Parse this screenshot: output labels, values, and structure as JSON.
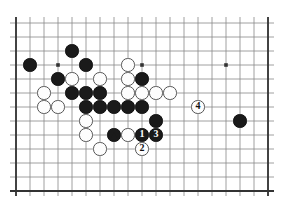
{
  "app": {
    "title": "Go board diagram",
    "type": "go-game-diagram"
  },
  "board": {
    "name": "go-board",
    "columns": 19,
    "rows": 13,
    "visible_columns": 19,
    "visible_rows": 13,
    "origin_x": 16,
    "origin_y": 23,
    "spacing": 14,
    "line_color": "#888888",
    "border_color": "#333333",
    "background_color": "#ffffff",
    "star_points": [
      {
        "col": 3,
        "row": 3
      },
      {
        "col": 9,
        "row": 3
      },
      {
        "col": 15,
        "row": 3
      }
    ],
    "edges": {
      "left": true,
      "top": true,
      "right": true,
      "bottom": true
    }
  },
  "stones": [
    {
      "col": 4,
      "row": 2,
      "color": "black",
      "label": "",
      "marker": ""
    },
    {
      "col": 1,
      "row": 3,
      "color": "black",
      "label": "",
      "marker": ""
    },
    {
      "col": 5,
      "row": 3,
      "color": "black",
      "label": "",
      "marker": ""
    },
    {
      "col": 8,
      "row": 3,
      "color": "white",
      "label": "",
      "marker": ""
    },
    {
      "col": 3,
      "row": 4,
      "color": "black",
      "label": "",
      "marker": ""
    },
    {
      "col": 4,
      "row": 4,
      "color": "white",
      "label": "",
      "marker": ""
    },
    {
      "col": 6,
      "row": 4,
      "color": "white",
      "label": "",
      "marker": ""
    },
    {
      "col": 8,
      "row": 4,
      "color": "white",
      "label": "",
      "marker": ""
    },
    {
      "col": 9,
      "row": 4,
      "color": "black",
      "label": "",
      "marker": ""
    },
    {
      "col": 2,
      "row": 5,
      "color": "white",
      "label": "",
      "marker": ""
    },
    {
      "col": 4,
      "row": 5,
      "color": "black",
      "label": "",
      "marker": ""
    },
    {
      "col": 5,
      "row": 5,
      "color": "black",
      "label": "",
      "marker": ""
    },
    {
      "col": 6,
      "row": 5,
      "color": "black",
      "label": "",
      "marker": ""
    },
    {
      "col": 8,
      "row": 5,
      "color": "white",
      "label": "",
      "marker": ""
    },
    {
      "col": 9,
      "row": 5,
      "color": "white",
      "label": "",
      "marker": ""
    },
    {
      "col": 10,
      "row": 5,
      "color": "white",
      "label": "",
      "marker": ""
    },
    {
      "col": 11,
      "row": 5,
      "color": "white",
      "label": "",
      "marker": ""
    },
    {
      "col": 2,
      "row": 6,
      "color": "white",
      "label": "",
      "marker": ""
    },
    {
      "col": 3,
      "row": 6,
      "color": "white",
      "label": "",
      "marker": ""
    },
    {
      "col": 5,
      "row": 6,
      "color": "black",
      "label": "",
      "marker": ""
    },
    {
      "col": 6,
      "row": 6,
      "color": "black",
      "label": "",
      "marker": ""
    },
    {
      "col": 7,
      "row": 6,
      "color": "black",
      "label": "",
      "marker": ""
    },
    {
      "col": 8,
      "row": 6,
      "color": "black",
      "label": "",
      "marker": ""
    },
    {
      "col": 9,
      "row": 6,
      "color": "black",
      "label": "",
      "marker": ""
    },
    {
      "col": 5,
      "row": 7,
      "color": "white",
      "label": "",
      "marker": ""
    },
    {
      "col": 10,
      "row": 7,
      "color": "black",
      "label": "",
      "marker": ""
    },
    {
      "col": 16,
      "row": 7,
      "color": "black",
      "label": "",
      "marker": ""
    },
    {
      "col": 13,
      "row": 6,
      "color": "white",
      "label": "4",
      "marker": "number"
    },
    {
      "col": 5,
      "row": 8,
      "color": "white",
      "label": "",
      "marker": ""
    },
    {
      "col": 7,
      "row": 8,
      "color": "black",
      "label": "",
      "marker": "triangle"
    },
    {
      "col": 8,
      "row": 8,
      "color": "white",
      "label": "",
      "marker": ""
    },
    {
      "col": 9,
      "row": 8,
      "color": "black",
      "label": "1",
      "marker": "number"
    },
    {
      "col": 10,
      "row": 8,
      "color": "black",
      "label": "3",
      "marker": "number"
    },
    {
      "col": 6,
      "row": 9,
      "color": "white",
      "label": "",
      "marker": ""
    },
    {
      "col": 9,
      "row": 9,
      "color": "white",
      "label": "2",
      "marker": "number"
    }
  ],
  "move_labels": {
    "one": "1",
    "two": "2",
    "three": "3",
    "four": "4",
    "triangle_marker": "triangle-marked-black-stone"
  },
  "colors": {
    "black_stone": "#1a1a1a",
    "white_stone": "#fdfdfd",
    "white_stone_outline": "#555555",
    "grid_line": "#888888",
    "board_border": "#333333",
    "page_background": "#ffffff"
  }
}
